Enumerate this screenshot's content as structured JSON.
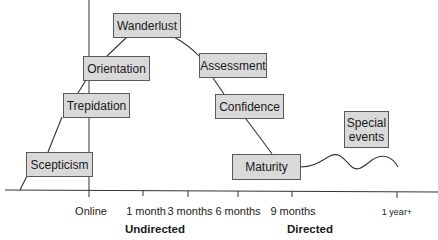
{
  "diagram": {
    "type": "timeline-curve",
    "stages": [
      {
        "label": "Scepticism"
      },
      {
        "label": "Trepidation"
      },
      {
        "label": "Orientation"
      },
      {
        "label": "Wanderlust"
      },
      {
        "label": "Assessment"
      },
      {
        "label": "Confidence"
      },
      {
        "label": "Maturity"
      },
      {
        "label": "Special events"
      }
    ],
    "special_events_lines": [
      "Special",
      "events"
    ],
    "axis": {
      "ticks": [
        "Online",
        "1 month",
        "3 months",
        "6 months",
        "9 months",
        "1 year+"
      ]
    },
    "phases": [
      "Undirected",
      "Directed"
    ],
    "colors": {
      "box_fill": "#d9d9d9",
      "box_border": "#5a5a5a",
      "line": "#333333"
    }
  }
}
